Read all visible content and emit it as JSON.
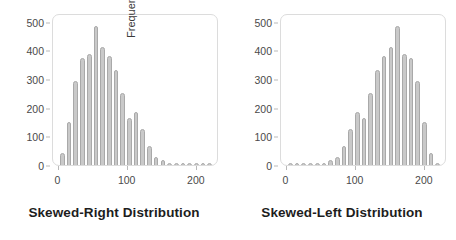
{
  "chart_data": [
    {
      "type": "bar",
      "title": "Skewed-Right Distribution",
      "xlabel": "",
      "ylabel": "Frequency",
      "xlim": [
        -8,
        232
      ],
      "ylim": [
        0,
        530
      ],
      "grid": false,
      "legend": null,
      "yticks": [
        0,
        100,
        200,
        300,
        400,
        500
      ],
      "ytick_labels": [
        "0",
        "100",
        "200",
        "300",
        "400",
        "500"
      ],
      "xticks": [
        0,
        100,
        200
      ],
      "xtick_labels": [
        "0",
        "100",
        "200"
      ],
      "bar_color": "#c9c9c9",
      "bar_edge_color": "#a9a9a9",
      "x": [
        8,
        18,
        28,
        38,
        48,
        58,
        68,
        78,
        88,
        98,
        108,
        118,
        128,
        138,
        148,
        158,
        168,
        178,
        188,
        198,
        208,
        218,
        226
      ],
      "categories": [
        "8",
        "18",
        "28",
        "38",
        "48",
        "58",
        "68",
        "78",
        "88",
        "98",
        "108",
        "118",
        "128",
        "138",
        "148",
        "158",
        "168",
        "178",
        "188",
        "198",
        "208",
        "218",
        "226"
      ],
      "values": [
        55,
        165,
        310,
        395,
        410,
        510,
        435,
        400,
        350,
        270,
        180,
        200,
        140,
        80,
        38,
        30,
        12,
        8,
        8,
        8,
        8,
        8,
        8
      ]
    },
    {
      "type": "bar",
      "title": "Skewed-Left Distribution",
      "xlabel": "",
      "ylabel": "Frequency",
      "xlim": [
        -8,
        232
      ],
      "ylim": [
        0,
        530
      ],
      "grid": false,
      "legend": null,
      "yticks": [
        0,
        100,
        200,
        300,
        400,
        500
      ],
      "ytick_labels": [
        "0",
        "100",
        "200",
        "300",
        "400",
        "500"
      ],
      "xticks": [
        0,
        100,
        200
      ],
      "xtick_labels": [
        "0",
        "100",
        "200"
      ],
      "bar_color": "#c9c9c9",
      "bar_edge_color": "#a9a9a9",
      "x": [
        8,
        18,
        28,
        38,
        48,
        58,
        68,
        78,
        88,
        98,
        108,
        118,
        128,
        138,
        148,
        158,
        168,
        178,
        188,
        198,
        208,
        218,
        226
      ],
      "categories": [
        "8",
        "18",
        "28",
        "38",
        "48",
        "58",
        "68",
        "78",
        "88",
        "98",
        "108",
        "118",
        "128",
        "138",
        "148",
        "158",
        "168",
        "178",
        "188",
        "198",
        "208",
        "218",
        "226"
      ],
      "values": [
        8,
        8,
        8,
        8,
        8,
        12,
        30,
        38,
        80,
        140,
        200,
        180,
        270,
        350,
        400,
        435,
        510,
        410,
        395,
        310,
        165,
        55,
        8
      ]
    }
  ],
  "panels": [
    {
      "caption": "Skewed-Right Distribution",
      "ylabel": "Frequency"
    },
    {
      "caption": "Skewed-Left Distribution",
      "ylabel": "Frequency"
    }
  ]
}
